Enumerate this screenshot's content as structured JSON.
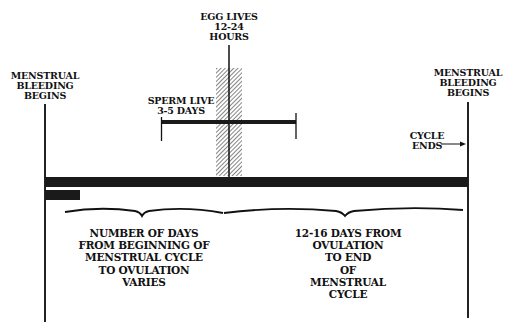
{
  "diagram": {
    "labels": {
      "left_start": "MENSTRUAL\nBLEEDING\nBEGINS",
      "right_start": "MENSTRUAL\nBLEEDING\nBEGINS",
      "egg": "EGG LIVES\n12-24\nHOURS",
      "sperm": "SPERM LIVE\n3-5 DAYS",
      "cycle_ends": "CYCLE\nENDS",
      "phase_1": "NUMBER OF DAYS\nFROM BEGINNING OF\nMENSTRUAL CYCLE\nTO OVULATION\nVARIES",
      "phase_2": "12-16 DAYS FROM\nOVULATION\nTO END\nOF\nMENSTRUAL\nCYCLE"
    },
    "colors": {
      "ink": "#111111",
      "background": "#ffffff"
    }
  }
}
